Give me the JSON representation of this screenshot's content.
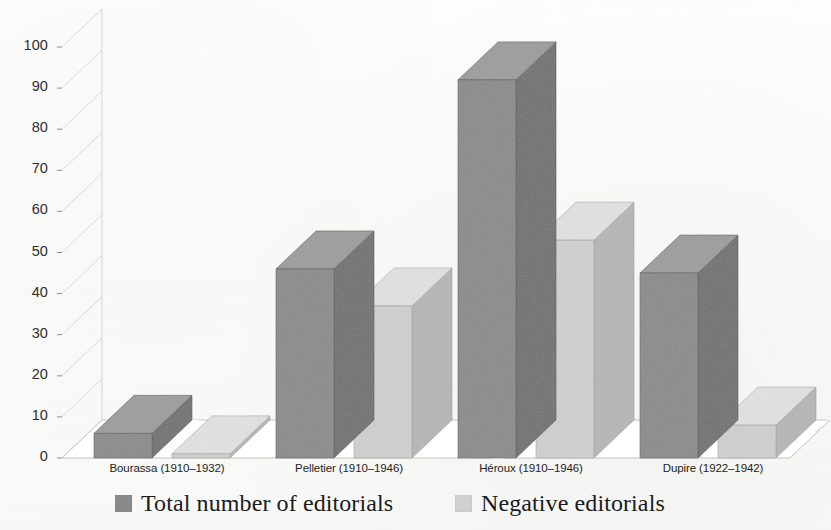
{
  "chart_data": {
    "type": "bar",
    "render": "3d-column",
    "title": "",
    "xlabel": "",
    "ylabel": "",
    "ylim": [
      0,
      100
    ],
    "ytick_step": 10,
    "yticks": [
      "0",
      "10",
      "20",
      "30",
      "40",
      "50",
      "60",
      "70",
      "80",
      "90",
      "100"
    ],
    "grid": true,
    "grid_orientation": "horizontal",
    "legend_position": "bottom",
    "categories": [
      "Bourassa (1910–1932)",
      "Pelletier (1910–1946)",
      "Héroux (1910–1946)",
      "Dupire (1922–1942)"
    ],
    "series": [
      {
        "name": "Total number of editorials",
        "color": "#8a8a8a",
        "values": [
          6,
          46,
          92,
          45
        ]
      },
      {
        "name": "Negative editorials",
        "color": "#d0d0d0",
        "values": [
          1,
          37,
          53,
          8
        ]
      }
    ]
  },
  "legend": {
    "entries": [
      {
        "label": "Total number of editorials",
        "color": "#8a8a8a"
      },
      {
        "label": "Negative editorials",
        "color": "#d0d0d0"
      }
    ]
  }
}
